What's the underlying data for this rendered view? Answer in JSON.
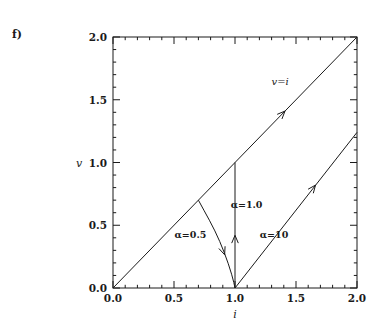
{
  "figure": {
    "panel_label": "f)",
    "background_color": "#ffffff",
    "line_color": "#1a1a1a"
  },
  "chart_data": {
    "type": "line",
    "title": "",
    "xlabel": "i",
    "ylabel": "v",
    "xlim": [
      0.0,
      2.0
    ],
    "ylim": [
      0.0,
      2.0
    ],
    "grid": false,
    "legend": "none",
    "xticks": [
      "0.0",
      "0.5",
      "1.0",
      "1.5",
      "2.0"
    ],
    "xtick_values": [
      0.0,
      0.5,
      1.0,
      1.5,
      2.0
    ],
    "yticks": [
      "0.0",
      "0.5",
      "1.0",
      "1.5",
      "2.0"
    ],
    "ytick_values": [
      0.0,
      0.5,
      1.0,
      1.5,
      2.0
    ],
    "minor_tick_step": 0.1,
    "series": [
      {
        "name": "v=i",
        "label": "v=i",
        "label_x": 1.37,
        "label_y": 1.62,
        "points": [
          [
            0.0,
            0.0
          ],
          [
            2.0,
            2.0
          ]
        ],
        "arrow_at": [
          1.41,
          1.41
        ]
      },
      {
        "name": "alpha-0.5",
        "label": "α=0.5",
        "label_x": 0.635,
        "label_y": 0.395,
        "points": [
          [
            0.7,
            0.7
          ],
          [
            0.745,
            0.62
          ],
          [
            0.79,
            0.54
          ],
          [
            0.835,
            0.455
          ],
          [
            0.875,
            0.37
          ],
          [
            0.912,
            0.282
          ],
          [
            0.945,
            0.193
          ],
          [
            0.972,
            0.11
          ],
          [
            0.99,
            0.045
          ],
          [
            1.0,
            0.0
          ]
        ],
        "arrow_at": [
          0.915,
          0.265
        ]
      },
      {
        "name": "alpha-1.0",
        "label": "α=1.0",
        "label_x": 1.095,
        "label_y": 0.635,
        "points": [
          [
            1.0,
            0.0
          ],
          [
            1.0,
            1.0
          ]
        ],
        "arrow_at": [
          1.0,
          0.42
        ]
      },
      {
        "name": "alpha-10",
        "label": "α=10",
        "label_x": 1.32,
        "label_y": 0.395,
        "points": [
          [
            1.0,
            0.0
          ],
          [
            2.0,
            1.24
          ]
        ],
        "arrow_at": [
          1.66,
          0.82
        ]
      }
    ]
  }
}
